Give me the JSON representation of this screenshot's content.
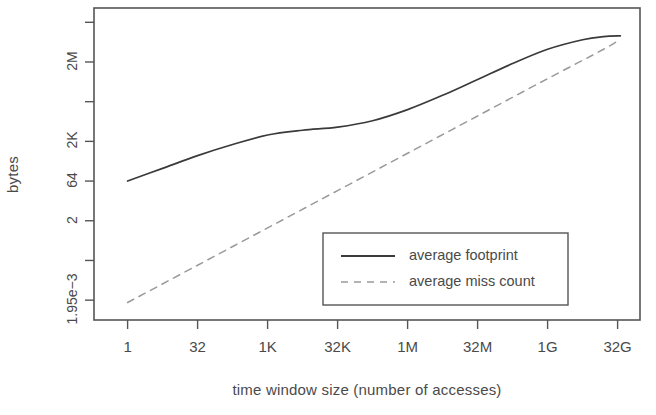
{
  "chart_data": {
    "type": "line",
    "title": "",
    "xlabel": "time window size (number of accesses)",
    "ylabel": "bytes",
    "grid": false,
    "x_scale": "log2",
    "y_scale": "log2",
    "x_tick_labels": [
      "1",
      "32",
      "1K",
      "32K",
      "1M",
      "32M",
      "1G",
      "32G"
    ],
    "x_tick_exponents": [
      0,
      5,
      10,
      15,
      20,
      25,
      30,
      35
    ],
    "y_tick_labels": [
      "",
      "2M",
      "",
      "2K",
      "64",
      "2",
      "",
      "1.95e−3"
    ],
    "y_tick_exponents": [
      26,
      21,
      16,
      11,
      6,
      1,
      -4,
      -9
    ],
    "xlim_exponents": [
      -2.4,
      36.6
    ],
    "ylim_exponents": [
      -11.5,
      27.8
    ],
    "legend_position": "bottom-right",
    "series": [
      {
        "name": "average footprint",
        "style": "solid",
        "color": "#3a3a3a",
        "x": [
          0,
          2.5,
          5,
          7.5,
          10,
          12.5,
          15,
          17.5,
          20,
          22.5,
          25,
          27.5,
          30,
          32.5,
          34,
          35.2
        ],
        "y": [
          6.0,
          7.6,
          9.2,
          10.6,
          11.8,
          12.4,
          12.8,
          13.6,
          15.0,
          16.8,
          18.8,
          20.8,
          22.6,
          23.8,
          24.2,
          24.3
        ]
      },
      {
        "name": "average miss count",
        "style": "dashed",
        "color": "#9a9a9a",
        "x": [
          0,
          5,
          10,
          15,
          20,
          25,
          30,
          34,
          35.2
        ],
        "y": [
          -9.3,
          -4.6,
          0.1,
          4.8,
          9.5,
          14.2,
          18.9,
          22.6,
          23.9
        ]
      }
    ]
  },
  "axes": {
    "y_title": "bytes",
    "x_title": "time window size (number of accesses)"
  },
  "legend": {
    "items": [
      {
        "label": "average footprint",
        "style": "solid"
      },
      {
        "label": "average miss count",
        "style": "dashed"
      }
    ]
  }
}
